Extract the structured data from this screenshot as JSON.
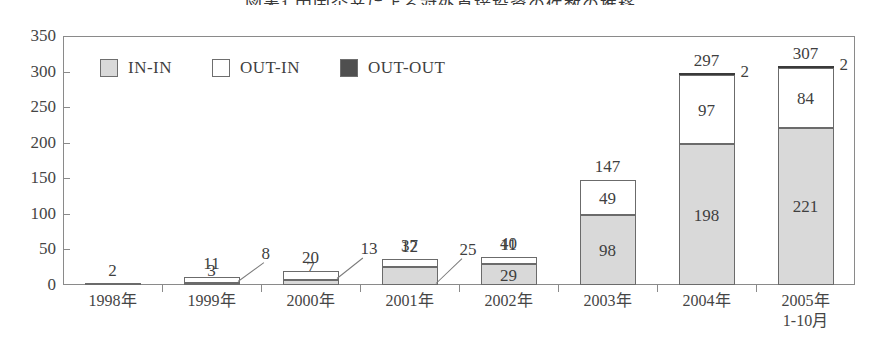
{
  "chart_title": "図表1 中国企業による対外直接投資の件数の推移",
  "legend": {
    "position": "top-left-inside",
    "items": [
      {
        "label": "IN-IN",
        "color": "#d9d9d9",
        "swatch": "legend-swatch-in-in"
      },
      {
        "label": "OUT-IN",
        "color": "#ffffff",
        "swatch": "legend-swatch-out-in"
      },
      {
        "label": "OUT-OUT",
        "color": "#4f4f4f",
        "swatch": "legend-swatch-out-out"
      }
    ]
  },
  "axes": {
    "y_ticks": [
      "350",
      "300",
      "250",
      "200",
      "150",
      "100",
      "50",
      "0"
    ],
    "y_min": 0,
    "y_max": 350,
    "y_step": 50,
    "grid": false
  },
  "chart_data": {
    "type": "bar",
    "subtype": "stacked",
    "title": "図表1 中国企業による対外直接投資の件数の推移",
    "xlabel": "",
    "ylabel": "",
    "ylim": [
      0,
      350
    ],
    "ytick_step": 50,
    "grid": false,
    "legend_position": "top-left-inside",
    "categories": [
      "1998年",
      "1999年",
      "2000年",
      "2001年",
      "2002年",
      "2003年",
      "2004年",
      "2005年 1-10月"
    ],
    "series": [
      {
        "name": "IN-IN",
        "color": "#d9d9d9",
        "values": [
          2,
          3,
          7,
          25,
          29,
          98,
          198,
          221
        ]
      },
      {
        "name": "OUT-IN",
        "color": "#ffffff",
        "values": [
          0,
          8,
          13,
          12,
          11,
          49,
          97,
          84
        ]
      },
      {
        "name": "OUT-OUT",
        "color": "#4f4f4f",
        "values": [
          0,
          0,
          0,
          0,
          0,
          0,
          2,
          2
        ]
      }
    ],
    "totals": [
      2,
      11,
      20,
      37,
      40,
      147,
      297,
      307
    ]
  },
  "bars": [
    {
      "category": "1998年",
      "category_line1": "1998年",
      "category_line2": "",
      "total": "2",
      "total_show": true,
      "segments": [
        {
          "series": "IN-IN",
          "value": 2,
          "label": "",
          "label_inside": false
        },
        {
          "series": "OUT-IN",
          "value": 0,
          "label": "",
          "label_inside": false
        },
        {
          "series": "OUT-OUT",
          "value": 0,
          "label": "",
          "label_inside": false
        }
      ],
      "callouts": []
    },
    {
      "category": "1999年",
      "category_line1": "1999年",
      "category_line2": "",
      "total": "11",
      "total_show": true,
      "segments": [
        {
          "series": "IN-IN",
          "value": 3,
          "label": "3",
          "label_inside": false
        },
        {
          "series": "OUT-IN",
          "value": 8,
          "label": "",
          "label_inside": false
        },
        {
          "series": "OUT-OUT",
          "value": 0,
          "label": "",
          "label_inside": false
        }
      ],
      "callouts": [
        {
          "text": "8",
          "target": "OUT-IN"
        }
      ]
    },
    {
      "category": "2000年",
      "category_line1": "2000年",
      "category_line2": "",
      "total": "20",
      "total_show": true,
      "segments": [
        {
          "series": "IN-IN",
          "value": 7,
          "label": "7",
          "label_inside": false
        },
        {
          "series": "OUT-IN",
          "value": 13,
          "label": "",
          "label_inside": false
        },
        {
          "series": "OUT-OUT",
          "value": 0,
          "label": "",
          "label_inside": false
        }
      ],
      "callouts": [
        {
          "text": "13",
          "target": "OUT-IN"
        }
      ]
    },
    {
      "category": "2001年",
      "category_line1": "2001年",
      "category_line2": "",
      "total": "37",
      "total_show": true,
      "segments": [
        {
          "series": "IN-IN",
          "value": 25,
          "label": "",
          "label_inside": false
        },
        {
          "series": "OUT-IN",
          "value": 12,
          "label": "12",
          "label_inside": false
        },
        {
          "series": "OUT-OUT",
          "value": 0,
          "label": "",
          "label_inside": false
        }
      ],
      "callouts": [
        {
          "text": "25",
          "target": "IN-IN"
        }
      ]
    },
    {
      "category": "2002年",
      "category_line1": "2002年",
      "category_line2": "",
      "total": "40",
      "total_show": true,
      "segments": [
        {
          "series": "IN-IN",
          "value": 29,
          "label": "29",
          "label_inside": true
        },
        {
          "series": "OUT-IN",
          "value": 11,
          "label": "11",
          "label_inside": false
        },
        {
          "series": "OUT-OUT",
          "value": 0,
          "label": "",
          "label_inside": false
        }
      ],
      "callouts": []
    },
    {
      "category": "2003年",
      "category_line1": "2003年",
      "category_line2": "",
      "total": "147",
      "total_show": true,
      "segments": [
        {
          "series": "IN-IN",
          "value": 98,
          "label": "98",
          "label_inside": true
        },
        {
          "series": "OUT-IN",
          "value": 49,
          "label": "49",
          "label_inside": true
        },
        {
          "series": "OUT-OUT",
          "value": 0,
          "label": "",
          "label_inside": false
        }
      ],
      "callouts": []
    },
    {
      "category": "2004年",
      "category_line1": "2004年",
      "category_line2": "",
      "total": "297",
      "total_show": true,
      "segments": [
        {
          "series": "IN-IN",
          "value": 198,
          "label": "198",
          "label_inside": true
        },
        {
          "series": "OUT-IN",
          "value": 97,
          "label": "97",
          "label_inside": true
        },
        {
          "series": "OUT-OUT",
          "value": 2,
          "label": "",
          "label_inside": false
        }
      ],
      "callouts": [
        {
          "text": "2",
          "target": "OUT-OUT"
        }
      ]
    },
    {
      "category": "2005年 1-10月",
      "category_line1": "2005年",
      "category_line2": "1-10月",
      "total": "307",
      "total_show": true,
      "segments": [
        {
          "series": "IN-IN",
          "value": 221,
          "label": "221",
          "label_inside": true
        },
        {
          "series": "OUT-IN",
          "value": 84,
          "label": "84",
          "label_inside": true
        },
        {
          "series": "OUT-OUT",
          "value": 2,
          "label": "",
          "label_inside": false
        }
      ],
      "callouts": [
        {
          "text": "2",
          "target": "OUT-OUT"
        }
      ]
    }
  ],
  "colors": {
    "in_in": "#d9d9d9",
    "out_in": "#ffffff",
    "out_out": "#4f4f4f",
    "axis": "#8a8a8a",
    "text": "#3f3f3f"
  }
}
